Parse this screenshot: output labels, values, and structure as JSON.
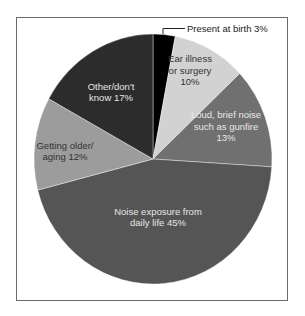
{
  "chart_data": {
    "type": "pie",
    "title": "",
    "start_angle_deg": 0,
    "direction": "clockwise",
    "slices": [
      {
        "label": "Present at birth",
        "value": 3,
        "display": "Present at birth 3%",
        "color": "#000000",
        "label_color": "#222222",
        "label_position": "outside-callout"
      },
      {
        "label": "Ear illness or surgery",
        "value": 10,
        "display_lines": [
          "Ear illness",
          "or surgery",
          "10%"
        ],
        "color": "#d2d2d2",
        "label_color": "#333333"
      },
      {
        "label": "Loud, brief noise such as gunfire",
        "value": 13,
        "display_lines": [
          "Loud, brief noise",
          "such as gunfire",
          "13%"
        ],
        "color": "#707070",
        "label_color": "#e8e8e8"
      },
      {
        "label": "Noise exposure from daily life",
        "value": 45,
        "display_lines": [
          "Noise exposure from",
          "daily life 45%"
        ],
        "color": "#555555",
        "label_color": "#e6e6e6"
      },
      {
        "label": "Getting older/aging",
        "value": 12,
        "display_lines": [
          "Getting older/",
          "aging 12%"
        ],
        "color": "#9c9c9c",
        "label_color": "#333333"
      },
      {
        "label": "Other/don't know",
        "value": 17,
        "display_lines": [
          "Other/don't",
          "know 17%"
        ],
        "color": "#2c2c2c",
        "label_color": "#e6e6e6"
      }
    ],
    "units": "%",
    "legend": "none"
  }
}
